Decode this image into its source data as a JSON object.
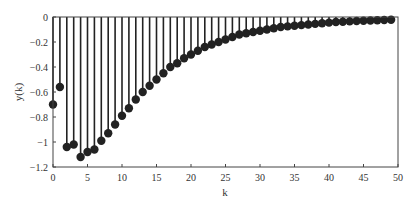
{
  "chart_data": {
    "type": "stem",
    "title": "",
    "xlabel": "k",
    "ylabel": "y(k)",
    "xlim": [
      0,
      50
    ],
    "ylim": [
      -1.2,
      0
    ],
    "xticks": [
      0,
      5,
      10,
      15,
      20,
      25,
      30,
      35,
      40,
      45,
      50
    ],
    "yticks": [
      0,
      -0.2,
      -0.4,
      -0.6,
      -0.8,
      -1,
      -1.2
    ],
    "xtick_labels": [
      "0",
      "5",
      "10",
      "15",
      "20",
      "25",
      "30",
      "35",
      "40",
      "45",
      "50"
    ],
    "ytick_labels": [
      "0",
      "-0.2",
      "-0.4",
      "-0.6",
      "-0.8",
      "-1",
      "-1.2"
    ],
    "grid": false,
    "legend": null,
    "series": [
      {
        "name": "y(k)",
        "color": "#222222",
        "x": [
          0,
          1,
          2,
          3,
          4,
          5,
          6,
          7,
          8,
          9,
          10,
          11,
          12,
          13,
          14,
          15,
          16,
          17,
          18,
          19,
          20,
          21,
          22,
          23,
          24,
          25,
          26,
          27,
          28,
          29,
          30,
          31,
          32,
          33,
          34,
          35,
          36,
          37,
          38,
          39,
          40,
          41,
          42,
          43,
          44,
          45,
          46,
          47,
          48,
          49
        ],
        "values": [
          -0.7,
          -0.56,
          -1.04,
          -1.02,
          -1.12,
          -1.08,
          -1.06,
          -0.99,
          -0.93,
          -0.86,
          -0.79,
          -0.73,
          -0.66,
          -0.6,
          -0.55,
          -0.5,
          -0.45,
          -0.4,
          -0.37,
          -0.33,
          -0.3,
          -0.27,
          -0.24,
          -0.22,
          -0.2,
          -0.18,
          -0.16,
          -0.14,
          -0.13,
          -0.12,
          -0.11,
          -0.1,
          -0.09,
          -0.08,
          -0.075,
          -0.07,
          -0.065,
          -0.06,
          -0.055,
          -0.05,
          -0.045,
          -0.04,
          -0.038,
          -0.035,
          -0.032,
          -0.03,
          -0.028,
          -0.026,
          -0.024,
          -0.022
        ]
      }
    ]
  }
}
